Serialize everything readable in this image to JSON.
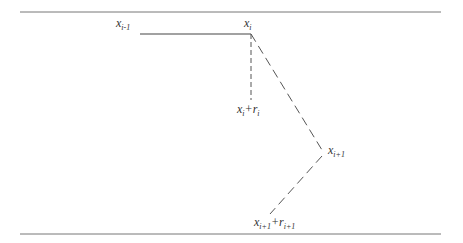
{
  "labels": {
    "x_prev": {
      "base": "x",
      "sub": "i-1"
    },
    "x_i": {
      "base": "x",
      "sub": "i"
    },
    "x_i_r": {
      "base": "x",
      "sub": "i",
      "plus": "+",
      "base2": "r",
      "sub2": "i"
    },
    "x_next": {
      "base": "x",
      "sub": "i+1"
    },
    "x_next_r": {
      "base": "x",
      "sub": "i+1",
      "plus": "+",
      "base2": "r",
      "sub2": "i+1"
    }
  },
  "colors": {
    "line": "#555555",
    "rule": "#777777"
  }
}
